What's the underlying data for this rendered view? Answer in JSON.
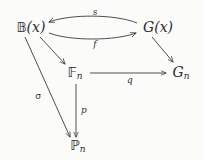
{
  "diagram": {
    "type": "commutative-diagram",
    "background_color": "#fbfbfa",
    "ink_color": "#2c2c2c",
    "nodes": [
      {
        "id": "Bx",
        "text": "𝔹(x)",
        "blackboard": "𝔹",
        "arg": "(x)",
        "x": 31,
        "y": 27
      },
      {
        "id": "Gx",
        "text": "G(x)",
        "blackboard": "G",
        "arg": "(x)",
        "x": 158,
        "y": 27
      },
      {
        "id": "Fn",
        "text": "𝔽n",
        "blackboard": "𝔽",
        "arg": "n",
        "x": 75,
        "y": 73
      },
      {
        "id": "Gn",
        "text": "Gn",
        "blackboard": "G",
        "arg": "n",
        "x": 181,
        "y": 73
      },
      {
        "id": "Pn",
        "text": "ℙn",
        "blackboard": "ℙ",
        "arg": "n",
        "x": 78,
        "y": 146
      }
    ],
    "edges": [
      {
        "id": "s",
        "from": "Gx",
        "to": "Bx",
        "label": "s",
        "label_x": 95,
        "label_y": 12,
        "style": "curved-up",
        "direction": "right-to-left"
      },
      {
        "id": "f",
        "from": "Bx",
        "to": "Gx",
        "label": "f",
        "label_x": 95,
        "label_y": 44,
        "style": "curved-down",
        "direction": "left-to-right"
      },
      {
        "id": "diag1",
        "from": "Bx",
        "to": "Fn",
        "label": "",
        "label_x": 0,
        "label_y": 0,
        "style": "straight",
        "direction": "down-right"
      },
      {
        "id": "diag2",
        "from": "Gx",
        "to": "Gn",
        "label": "",
        "label_x": 0,
        "label_y": 0,
        "style": "straight",
        "direction": "down-right"
      },
      {
        "id": "sigma",
        "from": "Bx",
        "to": "Pn",
        "label": "σ",
        "label_x": 38,
        "label_y": 96,
        "style": "straight",
        "direction": "down-right"
      },
      {
        "id": "q",
        "from": "Fn",
        "to": "Gn",
        "label": "q",
        "label_x": 130,
        "label_y": 80,
        "style": "straight",
        "direction": "left-to-right"
      },
      {
        "id": "p",
        "from": "Fn",
        "to": "Pn",
        "label": "p",
        "label_x": 84,
        "label_y": 110,
        "style": "straight",
        "direction": "downward"
      }
    ]
  }
}
